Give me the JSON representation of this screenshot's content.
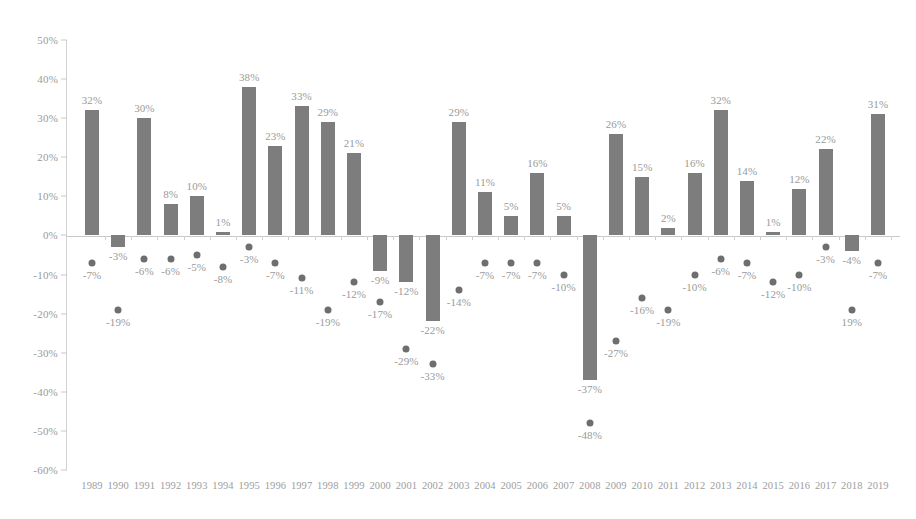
{
  "chart_data": {
    "type": "bar",
    "title": "",
    "subtitle": "",
    "xlabel": "",
    "ylabel": "",
    "ylim": [
      -60,
      50
    ],
    "ytick_step": 10,
    "grid": false,
    "legend_position": "none",
    "categories": [
      "1989",
      "1990",
      "1991",
      "1992",
      "1993",
      "1994",
      "1995",
      "1996",
      "1997",
      "1998",
      "1999",
      "2000",
      "2001",
      "2002",
      "2003",
      "2004",
      "2005",
      "2006",
      "2007",
      "2008",
      "2009",
      "2010",
      "2011",
      "2012",
      "2013",
      "2014",
      "2015",
      "2016",
      "2017",
      "2018",
      "2019"
    ],
    "ytick_labels": [
      "50%",
      "40%",
      "30%",
      "20%",
      "10%",
      "0%",
      "-10%",
      "-20%",
      "-30%",
      "-40%",
      "-50%",
      "-60%"
    ],
    "ytick_values": [
      50,
      40,
      30,
      20,
      10,
      0,
      -10,
      -20,
      -30,
      -40,
      -50,
      -60
    ],
    "series": [
      {
        "name": "annual-return-bars",
        "mark": "bar",
        "color": "#7d7d7d",
        "values": [
          32,
          -3,
          30,
          8,
          10,
          1,
          38,
          23,
          33,
          29,
          21,
          -9,
          -12,
          -22,
          29,
          11,
          5,
          16,
          5,
          -37,
          26,
          15,
          2,
          16,
          32,
          14,
          1,
          12,
          22,
          -4,
          31
        ],
        "labels": [
          "32%",
          "-3%",
          "30%",
          "8%",
          "10%",
          "1%",
          "38%",
          "23%",
          "33%",
          "29%",
          "21%",
          "-9%",
          "-12%",
          "-22%",
          "29%",
          "11%",
          "5%",
          "16%",
          "5%",
          "-37%",
          "26%",
          "15%",
          "2%",
          "16%",
          "32%",
          "14%",
          "1%",
          "12%",
          "22%",
          "-4%",
          "31%"
        ]
      },
      {
        "name": "intra-year-decline-dots",
        "mark": "scatter",
        "color": "#6e6e6e",
        "values": [
          -7,
          -19,
          -6,
          -6,
          -5,
          -8,
          -3,
          -7,
          -11,
          -19,
          -12,
          -17,
          -29,
          -33,
          -14,
          -7,
          -7,
          -7,
          -10,
          -48,
          -27,
          -16,
          -19,
          -10,
          -6,
          -7,
          -12,
          -10,
          -3,
          -19,
          -7
        ],
        "labels": [
          "-7%",
          "-19%",
          "-6%",
          "-6%",
          "-5%",
          "-8%",
          "-3%",
          "-7%",
          "-11%",
          "-19%",
          "-12%",
          "-17%",
          "-29%",
          "-33%",
          "-14%",
          "-7%",
          "-7%",
          "-7%",
          "-10%",
          "-48%",
          "-27%",
          "-16%",
          "-19%",
          "-10%",
          "-6%",
          "-7%",
          "-12%",
          "-10%",
          "-3%",
          "19%",
          "-7%"
        ]
      }
    ],
    "colors": {
      "bar": "#7d7d7d",
      "dot": "#6e6e6e",
      "axis": "#c9c9c9",
      "text": "#9a9a9a",
      "background": "#ffffff"
    }
  }
}
